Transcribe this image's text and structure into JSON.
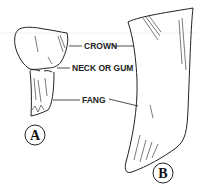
{
  "diagram": {
    "labels": {
      "crown": "CROWN",
      "neck": "NECK OR GUM",
      "fang": "FANG"
    },
    "figures": {
      "a": "A",
      "b": "B"
    },
    "colors": {
      "line": "#222222",
      "background": "#ffffff"
    }
  }
}
